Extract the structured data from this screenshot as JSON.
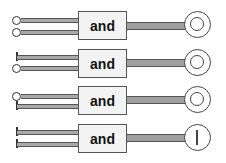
{
  "diagram": {
    "gates": [
      {
        "label": "and",
        "inputs": [
          "circle",
          "circle"
        ],
        "output": "double-circle"
      },
      {
        "label": "and",
        "inputs": [
          "bar",
          "circle"
        ],
        "output": "double-circle"
      },
      {
        "label": "and",
        "inputs": [
          "circle",
          "bar"
        ],
        "output": "double-circle"
      },
      {
        "label": "and",
        "inputs": [
          "bar",
          "bar"
        ],
        "output": "circle-with-vertical-line"
      }
    ],
    "colors": {
      "line": "#a9a9a9",
      "box_fill": "#f3f3f3",
      "stroke": "#444444"
    }
  }
}
